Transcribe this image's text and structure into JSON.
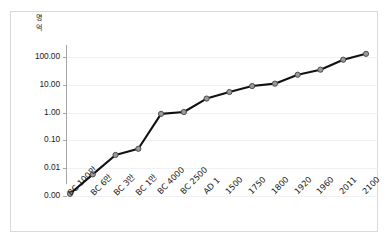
{
  "chart_data": {
    "type": "line",
    "title": "",
    "subtitle": "",
    "xlabel": "",
    "ylabel": "명\n억",
    "ylabel_note": "y-axis unit label, Korean glyphs stacked vertically",
    "yscale": "log",
    "ylim": [
      0.001,
      300
    ],
    "ytick_labels": [
      "100.00",
      "10.00",
      "1.00",
      "0.10",
      "0.01",
      "0.00"
    ],
    "ytick_values": [
      100,
      10,
      1,
      0.1,
      0.01,
      0.001
    ],
    "grid": true,
    "legend": false,
    "marker": "circle",
    "categories": [
      "BC 100만",
      "BC 6만",
      "BC 3만",
      "BC 1만",
      "BC 4000",
      "BC 2500",
      "AD 1",
      "1500",
      "1750",
      "1800",
      "1920",
      "1960",
      "2011",
      "2100"
    ],
    "values": [
      0.0012,
      0.006,
      0.03,
      0.05,
      0.9,
      1.05,
      3.2,
      5.5,
      9.0,
      11.0,
      23.0,
      35.0,
      80.0,
      130.0
    ],
    "colors": {
      "line": "#111111",
      "marker_fill": "#9a9a9a",
      "marker_stroke": "#4d4d4d",
      "gridline": "#f1f1f1",
      "axis": "#a6a6a6",
      "frame": "#d9d9d9",
      "background": "#ffffff",
      "text": "#1a1a1a"
    }
  }
}
